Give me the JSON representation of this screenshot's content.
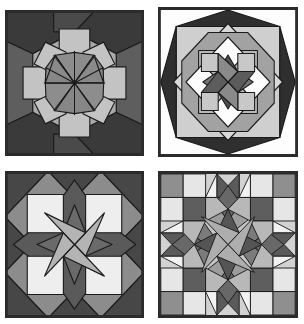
{
  "image": {
    "subject": "quilt-block-samples",
    "background_color": "#ffffff",
    "layout": "2x2 grid of four square quilt blocks",
    "width": 304,
    "height": 324
  },
  "palette": {
    "outline": "#1a1a1a",
    "white": "#fdfdfd",
    "near_white": "#ededed",
    "light": "#d8d8d8",
    "light_gray": "#c2c2c2",
    "medium_light": "#a8a8a8",
    "medium": "#8e8e8e",
    "medium_dark": "#707070",
    "dark": "#4a4a4a",
    "very_dark": "#2e2e2e",
    "frame": "#2b2b2b"
  },
  "panels": [
    {
      "id": "panel-1",
      "name": "dutch-rose-pinwheel-block",
      "position": "top-left",
      "description": "Eight point star block with radiating center octagon, light square patches and dark corner kites",
      "frame_color": "#2b2b2b",
      "background_color": "#e8e8e8"
    },
    {
      "id": "panel-2",
      "name": "carpenters-wheel-block",
      "position": "top-right",
      "description": "Carpenter's wheel set on point inside a dark diamond border with white corner triangles",
      "frame_color": "#2b2b2b",
      "background_color": "#fdfdfd"
    },
    {
      "id": "panel-3",
      "name": "lemoyne-star-block",
      "position": "bottom-left",
      "description": "Eight point LeMoyne star with white corner squares and dark background triangles",
      "frame_color": "#2b2b2b",
      "background_color": "#9a9a9a"
    },
    {
      "id": "panel-4",
      "name": "broken-star-block",
      "position": "bottom-right",
      "description": "Broken star / lone star with concentric rings of diamonds in graded grays",
      "frame_color": "#2b2b2b",
      "background_color": "#d0d0d0"
    }
  ]
}
